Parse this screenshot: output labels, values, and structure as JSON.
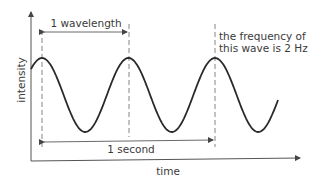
{
  "diagram": {
    "type": "wave-diagram",
    "x_axis_label": "time",
    "y_axis_label": "intensity",
    "wavelength_label": "1 wavelength",
    "period_label": "1 second",
    "frequency_note_line1": "the frequency of",
    "frequency_note_line2": "this wave is 2 Hz",
    "frequency_hz": 2,
    "cycles_shown": 2.8,
    "colors": {
      "line": "#2a2a2a",
      "text": "#3a3a3a"
    }
  }
}
